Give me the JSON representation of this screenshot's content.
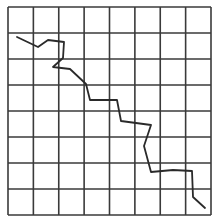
{
  "diagram": {
    "type": "grid-with-path",
    "grid": {
      "rows": 8,
      "cols": 8,
      "left": 8,
      "top": 7,
      "right": 211,
      "bottom": 215,
      "line_color": "#3a3a3a",
      "line_width": 1.6
    },
    "path": {
      "color": "#2a2a2a",
      "width": 1.8,
      "points": [
        [
          17,
          37
        ],
        [
          38,
          47
        ],
        [
          48,
          40
        ],
        [
          64,
          42
        ],
        [
          63,
          58
        ],
        [
          53,
          67
        ],
        [
          70,
          69
        ],
        [
          86,
          84
        ],
        [
          90,
          100
        ],
        [
          117,
          100
        ],
        [
          121,
          121
        ],
        [
          151,
          125
        ],
        [
          144,
          146
        ],
        [
          151,
          172
        ],
        [
          173,
          170
        ],
        [
          192,
          171
        ],
        [
          193,
          197
        ],
        [
          205,
          208
        ]
      ]
    }
  }
}
